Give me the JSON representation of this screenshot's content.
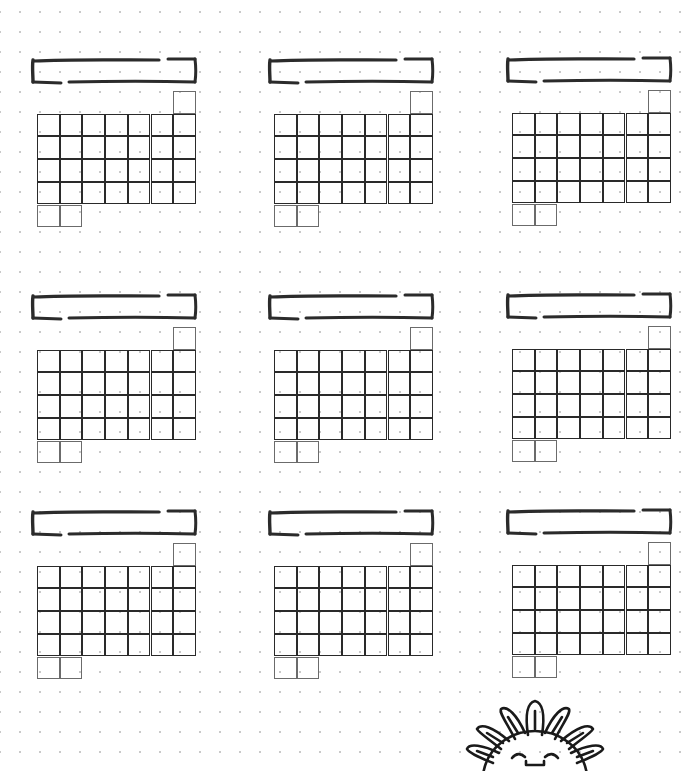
{
  "page": {
    "type": "bullet-journal printable",
    "background": "#ffffff",
    "dot_color": "#c9c9c9",
    "line_color": "#2a2a2a"
  },
  "header_text": "",
  "calendars": [
    {
      "id": "month-1",
      "title": "",
      "x": 31,
      "y": 57
    },
    {
      "id": "month-2",
      "title": "",
      "x": 268,
      "y": 57
    },
    {
      "id": "month-3",
      "title": "",
      "x": 506,
      "y": 56
    },
    {
      "id": "month-4",
      "title": "",
      "x": 31,
      "y": 293
    },
    {
      "id": "month-5",
      "title": "",
      "x": 268,
      "y": 293
    },
    {
      "id": "month-6",
      "title": "",
      "x": 506,
      "y": 292
    },
    {
      "id": "month-7",
      "title": "",
      "x": 31,
      "y": 509
    },
    {
      "id": "month-8",
      "title": "",
      "x": 268,
      "y": 509
    },
    {
      "id": "month-9",
      "title": "",
      "x": 506,
      "y": 508
    }
  ],
  "grid_layout": {
    "columns": 7,
    "full_rows": 4,
    "top_extra_cells": 1,
    "bottom_extra_cells": 2,
    "total_cells": 31
  },
  "decoration": {
    "name": "smiling-sun-flower",
    "position": "bottom-right"
  }
}
